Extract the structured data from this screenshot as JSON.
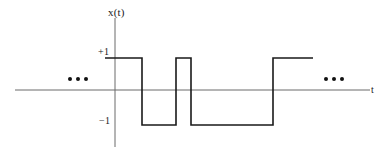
{
  "figure": {
    "title": "",
    "signal_label": "x(t)",
    "time_axis_label": "t",
    "level_labels": {
      "high": "+1",
      "low": "−1"
    },
    "continuation_left": "•••",
    "continuation_right": "•••",
    "colors": {
      "waveform": "#1a1a1a",
      "axis": "#6b6b6b",
      "text": "#1a1a1a",
      "background": "#ffffff"
    }
  },
  "chart_data": {
    "type": "line",
    "title": "x(t)",
    "xlabel": "t",
    "ylabel": "x(t)",
    "ylim": [
      -1.6,
      1.9
    ],
    "yticks": [
      1,
      -1
    ],
    "ytick_labels": [
      "+1",
      "−1"
    ],
    "grid": false,
    "legend": null,
    "signal_levels": [
      1,
      -1
    ],
    "segments": [
      {
        "index": 0,
        "x_start": 105,
        "x_end": 142,
        "level": 1
      },
      {
        "index": 1,
        "x_start": 142,
        "x_end": 176,
        "level": -1
      },
      {
        "index": 2,
        "x_start": 176,
        "x_end": 191,
        "level": 1
      },
      {
        "index": 3,
        "x_start": 191,
        "x_end": 273,
        "level": -1
      },
      {
        "index": 4,
        "x_start": 273,
        "x_end": 313,
        "level": 1
      }
    ],
    "x": [
      105,
      142,
      142,
      176,
      176,
      191,
      191,
      273,
      273,
      313
    ],
    "y": [
      1,
      1,
      -1,
      -1,
      1,
      1,
      -1,
      -1,
      1,
      1
    ],
    "annotations": [
      {
        "name": "ellipsis-left",
        "text": "•••",
        "x": 78,
        "y": 0
      },
      {
        "name": "ellipsis-right",
        "text": "•••",
        "x": 334,
        "y": 0
      }
    ],
    "axes": {
      "vertical_axis_x": 115,
      "horizontal_axis_y": 90,
      "horizontal_axis_x_start": 15,
      "horizontal_axis_x_end": 370,
      "vertical_axis_y_top": 18,
      "vertical_axis_y_bottom": 147,
      "level_high_y": 58,
      "level_low_y": 125
    }
  }
}
